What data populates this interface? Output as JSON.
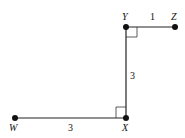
{
  "diagram": {
    "points": {
      "W": {
        "label": "W",
        "x": 15,
        "y": 118
      },
      "X": {
        "label": "X",
        "x": 126,
        "y": 118
      },
      "Y": {
        "label": "Y",
        "x": 126,
        "y": 27
      },
      "Z": {
        "label": "Z",
        "x": 175,
        "y": 27
      }
    },
    "segments": [
      {
        "from": "W",
        "to": "X",
        "length_label": "3"
      },
      {
        "from": "X",
        "to": "Y",
        "length_label": "3"
      },
      {
        "from": "Y",
        "to": "Z",
        "length_label": "1"
      }
    ],
    "right_angles": [
      "X",
      "Y"
    ],
    "line_color": "#222222"
  }
}
